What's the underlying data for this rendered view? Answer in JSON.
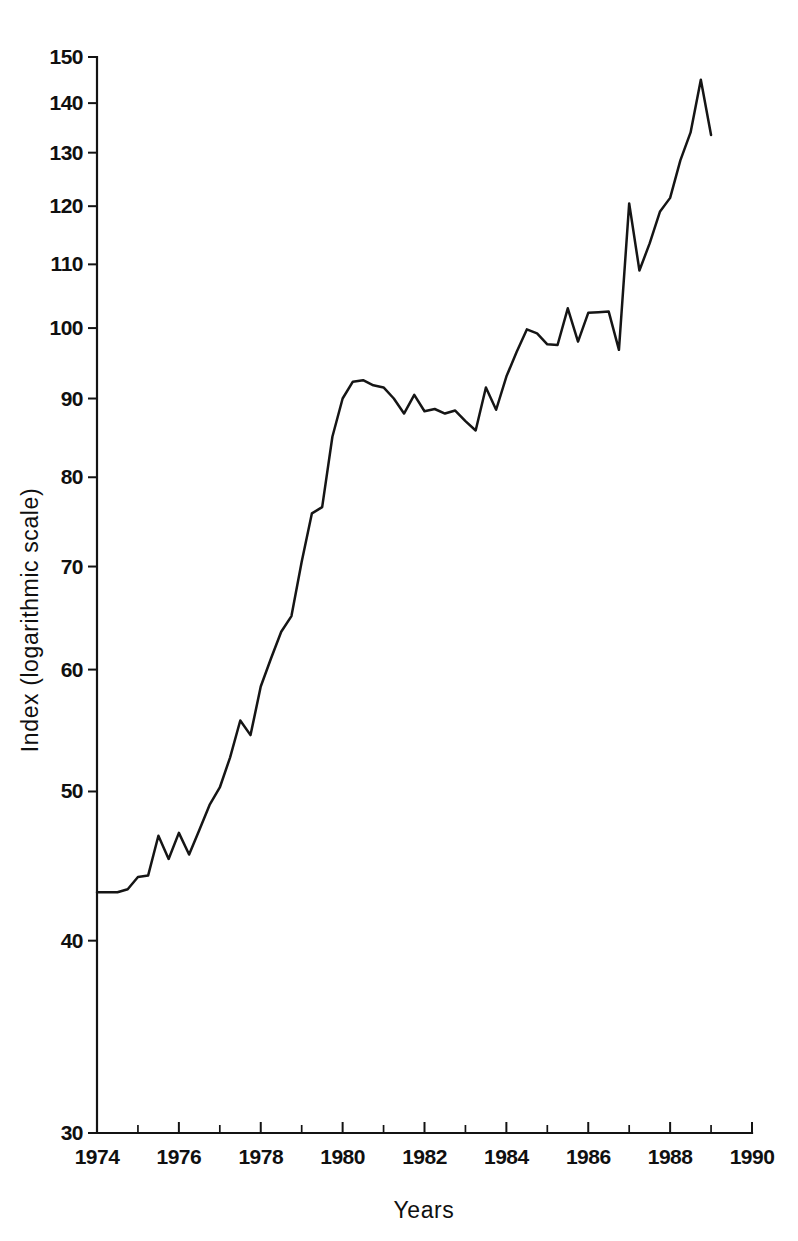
{
  "chart_data": {
    "type": "line",
    "title": "",
    "xlabel": "Years",
    "ylabel": "Index (logarithmic scale)",
    "yscale": "log",
    "xscale": "linear",
    "xlim": [
      1974,
      1990
    ],
    "ylim": [
      30,
      150
    ],
    "grid": false,
    "legend": null,
    "y_ticks": [
      30,
      40,
      50,
      60,
      70,
      80,
      90,
      100,
      110,
      120,
      130,
      140,
      150
    ],
    "y_tick_labels": [
      "30",
      "40",
      "50",
      "60",
      "70",
      "80",
      "90",
      "100",
      "110",
      "120",
      "130",
      "140",
      "150"
    ],
    "x_ticks": [
      1974,
      1976,
      1978,
      1980,
      1982,
      1984,
      1986,
      1988,
      1990
    ],
    "x_tick_labels": [
      "1974",
      "1976",
      "1978",
      "1980",
      "1982",
      "1984",
      "1986",
      "1988",
      "1990"
    ],
    "x_minor_ticks": [
      1975,
      1977,
      1979,
      1981,
      1983,
      1985,
      1987,
      1989
    ],
    "line_color": "#151515",
    "background_color": "#ffffff",
    "series": [
      {
        "name": "Index",
        "x": [
          1974.0,
          1974.25,
          1974.5,
          1974.75,
          1975.0,
          1975.25,
          1975.5,
          1975.75,
          1976.0,
          1976.25,
          1976.5,
          1976.75,
          1977.0,
          1977.25,
          1977.5,
          1977.75,
          1978.0,
          1978.25,
          1978.5,
          1978.75,
          1979.0,
          1979.25,
          1979.5,
          1979.75,
          1980.0,
          1980.25,
          1980.5,
          1980.75,
          1981.0,
          1981.25,
          1981.5,
          1981.75,
          1982.0,
          1982.25,
          1982.5,
          1982.75,
          1983.0,
          1983.25,
          1983.5,
          1983.75,
          1984.0,
          1984.25,
          1984.5,
          1984.75,
          1985.0,
          1985.25,
          1985.5,
          1985.75,
          1986.0,
          1986.25,
          1986.5,
          1986.75,
          1987.0,
          1987.25,
          1987.5,
          1987.75,
          1988.0,
          1988.25,
          1988.5,
          1988.75,
          1989.0
        ],
        "y": [
          43.0,
          43.0,
          43.0,
          43.2,
          44.0,
          44.1,
          46.8,
          45.2,
          47.0,
          45.5,
          47.2,
          49.0,
          50.3,
          52.6,
          55.6,
          54.4,
          58.5,
          61.0,
          63.5,
          65.0,
          70.5,
          75.8,
          76.5,
          85.0,
          90.0,
          92.3,
          92.5,
          91.8,
          91.5,
          90.0,
          88.0,
          90.5,
          88.3,
          88.6,
          88.0,
          88.4,
          87.0,
          85.8,
          91.5,
          88.5,
          93.0,
          96.5,
          99.8,
          99.2,
          97.6,
          97.5,
          103.0,
          98.0,
          102.3,
          102.4,
          102.5,
          96.8,
          120.5,
          109.0,
          113.5,
          119.0,
          121.5,
          128.5,
          134.0,
          145.0,
          133.5
        ]
      }
    ]
  },
  "axes": {
    "y_title": "Index (logarithmic scale)",
    "x_title": "Years"
  }
}
